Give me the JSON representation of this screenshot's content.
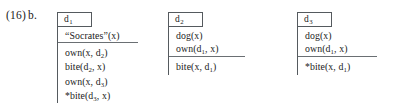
{
  "example": {
    "number": "(16)",
    "letter": "b."
  },
  "boxes": [
    {
      "label_base": "d",
      "label_sub": "1",
      "upper": [
        {
          "text": "“Socrates”(x)",
          "star": false
        }
      ],
      "lower": [
        {
          "text": "own(x, d",
          "sub": "2",
          "tail": ")",
          "star": false
        },
        {
          "text": "bite(d",
          "sub": "2",
          "tail": ", x)",
          "star": false
        },
        {
          "text": "own(x, d",
          "sub": "3",
          "tail": ")",
          "star": false
        },
        {
          "text": "bite(d",
          "sub": "3",
          "tail": ", x)",
          "star": true
        }
      ]
    },
    {
      "label_base": "d",
      "label_sub": "2",
      "upper": [
        {
          "text": "dog(x)",
          "star": false
        },
        {
          "text": "own(d",
          "sub": "1",
          "tail": ", x)",
          "star": false
        }
      ],
      "lower": [
        {
          "text": "bite(x, d",
          "sub": "1",
          "tail": ")",
          "star": false
        }
      ]
    },
    {
      "label_base": "d",
      "label_sub": "3",
      "upper": [
        {
          "text": "dog(x)",
          "star": false
        },
        {
          "text": "own(d",
          "sub": "1",
          "tail": ", x)",
          "star": false
        }
      ],
      "lower": [
        {
          "text": "bite(x, d",
          "sub": "1",
          "tail": ")",
          "star": true
        }
      ]
    }
  ],
  "symbols": {
    "ungrammatical_star": "*"
  },
  "colors": {
    "border": "#555a5e",
    "text": "#1a1a1a",
    "background": "#ffffff"
  }
}
